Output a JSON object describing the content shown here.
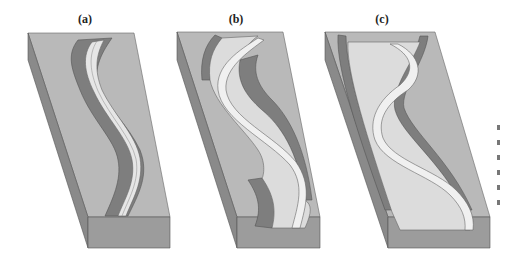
{
  "figure": {
    "panels": [
      {
        "id": "a",
        "label": "(a)",
        "description": "Narrow meandering stream in V-shaped valley with steep eroded walls"
      },
      {
        "id": "b",
        "label": "(b)",
        "description": "Valley widened with floodplain developing; meanders migrate"
      },
      {
        "id": "c",
        "label": "(c)",
        "description": "Broad floodplain with meandering stream; valley walls far apart"
      }
    ],
    "colors": {
      "plateau_top": "#b9b9b9",
      "block_side_left": "#8a8a8a",
      "block_front": "#9a9a9a",
      "valley_wall": "#7e7e7e",
      "floodplain": "#dcdcdc",
      "stream": "#f0f0f0",
      "outline": "#555555"
    }
  }
}
